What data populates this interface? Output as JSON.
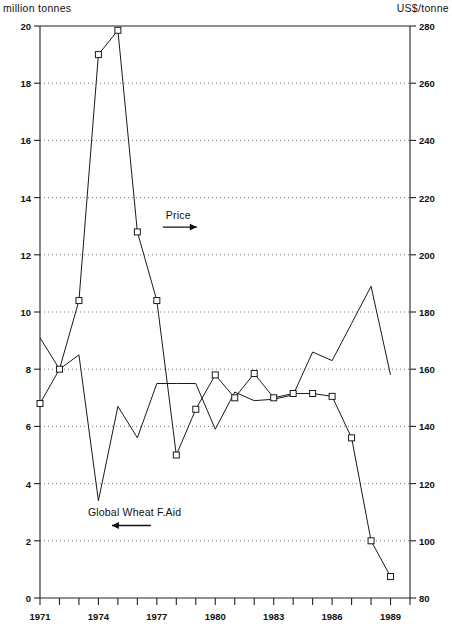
{
  "chart_data": {
    "type": "line",
    "title": "",
    "subtitle": "",
    "xlabel": "",
    "ylabel": "million tonnes",
    "y2label": "US$/tonne",
    "grid": "horizontal-dotted",
    "legend_position": "inline-annotations",
    "x": [
      1971,
      1972,
      1973,
      1974,
      1975,
      1976,
      1977,
      1978,
      1979,
      1980,
      1981,
      1982,
      1983,
      1984,
      1985,
      1986,
      1987,
      1988,
      1989
    ],
    "xlim": [
      1971,
      1990
    ],
    "xtick_labels": [
      "1971",
      "1974",
      "1977",
      "1980",
      "1983",
      "1986",
      "1989"
    ],
    "xtick_values": [
      1971,
      1974,
      1977,
      1980,
      1983,
      1986,
      1989
    ],
    "ylim": [
      0,
      20
    ],
    "ytick_labels": [
      "0",
      "2",
      "4",
      "6",
      "8",
      "10",
      "12",
      "14",
      "16",
      "18",
      "20"
    ],
    "ytick_values": [
      0,
      2,
      4,
      6,
      8,
      10,
      12,
      14,
      16,
      18,
      20
    ],
    "y2lim": [
      80,
      280
    ],
    "y2tick_labels": [
      "80",
      "100",
      "120",
      "140",
      "160",
      "180",
      "200",
      "220",
      "240",
      "260",
      "280"
    ],
    "y2tick_values": [
      80,
      100,
      120,
      140,
      160,
      180,
      200,
      220,
      240,
      260,
      280
    ],
    "series": [
      {
        "name": "Global Wheat F.Aid",
        "axis": "left",
        "unit": "million tonnes",
        "marker": "none",
        "color": "#1a1a1a",
        "values": [
          9.1,
          8.0,
          8.5,
          3.4,
          6.7,
          5.6,
          7.5,
          7.5,
          7.5,
          5.9,
          7.2,
          6.9,
          6.95,
          7.1,
          8.6,
          8.3,
          9.6,
          10.9,
          7.8
        ]
      },
      {
        "name": "Price",
        "axis": "right",
        "unit": "US$/tonne",
        "marker": "open-square",
        "color": "#1a1a1a",
        "values_left_scale": [
          6.8,
          8.0,
          10.4,
          19.0,
          19.85,
          12.8,
          10.4,
          5.0,
          6.6,
          7.8,
          7.0,
          7.85,
          7.0,
          7.15,
          7.15,
          7.05,
          5.6,
          2.0,
          0.75
        ],
        "values": [
          148,
          160,
          184,
          270,
          278.5,
          208,
          184,
          130,
          146,
          158,
          150,
          158.5,
          150,
          151.5,
          151.5,
          150.5,
          136,
          100,
          87.5
        ]
      }
    ],
    "annotations": [
      {
        "name": "price-annotation",
        "text": "Price",
        "arrow": "right",
        "x": 1977,
        "y_left_scale": 12.9
      },
      {
        "name": "food-aid-annotation",
        "text": "Global Wheat F.Aid",
        "arrow": "left",
        "x": 1975,
        "y_left_scale": 2.5
      }
    ]
  },
  "chart": {
    "unit_left": "million tonnes",
    "unit_right": "US$/tonne",
    "price_label": "Price",
    "foodaid_label": "Global Wheat F.Aid"
  }
}
